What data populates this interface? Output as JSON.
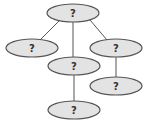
{
  "diagram": {
    "type": "tree",
    "colors": {
      "node_fill": "#e3e3e3",
      "node_stroke": "#555555",
      "edge": "#555555",
      "text": "#333333"
    },
    "nodes": [
      {
        "id": "root",
        "label": "?",
        "cx": 73,
        "cy": 13
      },
      {
        "id": "left",
        "label": "?",
        "cx": 32,
        "cy": 48
      },
      {
        "id": "middle",
        "label": "?",
        "cx": 74,
        "cy": 66
      },
      {
        "id": "right",
        "label": "?",
        "cx": 116,
        "cy": 48
      },
      {
        "id": "right-child",
        "label": "?",
        "cx": 116,
        "cy": 86
      },
      {
        "id": "middle-child",
        "label": "?",
        "cx": 74,
        "cy": 110
      }
    ],
    "edges": [
      {
        "from": "root",
        "to": "left"
      },
      {
        "from": "root",
        "to": "middle"
      },
      {
        "from": "root",
        "to": "right"
      },
      {
        "from": "middle",
        "to": "middle-child"
      },
      {
        "from": "right",
        "to": "right-child"
      }
    ]
  }
}
